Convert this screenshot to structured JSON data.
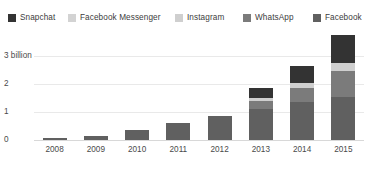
{
  "legend": {
    "items": [
      {
        "label": "Snapchat",
        "color": "#333333",
        "icon": "legend-swatch-icon"
      },
      {
        "label": "Facebook Messenger",
        "color": "#d3d3d3",
        "icon": "legend-swatch-icon"
      },
      {
        "label": "Instagram",
        "color": "#cfcfcf",
        "icon": "legend-swatch-icon"
      },
      {
        "label": "WhatsApp",
        "color": "#7b7b7b",
        "icon": "legend-swatch-icon"
      },
      {
        "label": "Facebook",
        "color": "#606060",
        "icon": "legend-swatch-icon"
      }
    ]
  },
  "axes": {
    "yticks": [
      "3 billion",
      "2",
      "1",
      "0"
    ],
    "xticks": [
      "2008",
      "2009",
      "2010",
      "2011",
      "2012",
      "2013",
      "2014",
      "2015"
    ]
  },
  "footnote": "",
  "chart_data": {
    "type": "bar",
    "stacked": true,
    "title": "",
    "subtitle": "",
    "xlabel": "",
    "ylabel": "",
    "unit": "billion monthly active users",
    "ylim": [
      0,
      3
    ],
    "yticks": [
      0,
      1,
      2,
      3
    ],
    "ytick_labels": [
      "0",
      "1",
      "2",
      "3 billion"
    ],
    "grid": true,
    "legend_position": "top",
    "categories": [
      "2008",
      "2009",
      "2010",
      "2011",
      "2012",
      "2013",
      "2014",
      "2015"
    ],
    "series": [
      {
        "name": "Facebook",
        "color": "#606060",
        "values": [
          0.06,
          0.15,
          0.35,
          0.6,
          0.85,
          1.1,
          1.35,
          1.55
        ]
      },
      {
        "name": "WhatsApp",
        "color": "#7b7b7b",
        "values": [
          0,
          0,
          0,
          0,
          0,
          0.3,
          0.5,
          0.9
        ]
      },
      {
        "name": "Instagram",
        "color": "#cfcfcf",
        "values": [
          0,
          0,
          0,
          0,
          0,
          0.1,
          0.2,
          0.3
        ]
      },
      {
        "name": "Facebook Messenger",
        "color": "#d3d3d3",
        "values": [
          0,
          0,
          0,
          0,
          0,
          0,
          0,
          0
        ]
      },
      {
        "name": "Snapchat",
        "color": "#333333",
        "values": [
          0,
          0,
          0,
          0,
          0,
          0.35,
          0.6,
          1.0
        ]
      }
    ],
    "totals": [
      0.06,
      0.15,
      0.35,
      0.6,
      0.85,
      1.85,
      2.65,
      3.75
    ]
  }
}
